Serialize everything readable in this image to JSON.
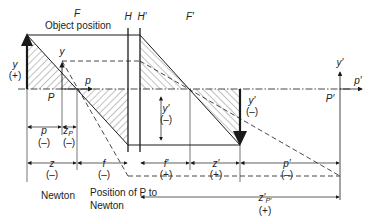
{
  "figure": {
    "title": "Object position",
    "principal_planes": {
      "H": "H",
      "H_prime": "H′"
    },
    "focal_points": {
      "F": "F",
      "F_prime": "F′"
    },
    "object": {
      "label": "y",
      "sign": "(+)"
    },
    "image": {
      "label": "y′",
      "sign": "(–)"
    },
    "image_mid": {
      "label": "y′",
      "sign": "(–)"
    },
    "pupil": {
      "P": "P",
      "y": "y",
      "p": "p"
    },
    "pupil_image": {
      "P_prime": "P′",
      "y_prime": "y′",
      "p_prime": "p′"
    },
    "dimensions": {
      "p": {
        "label": "p",
        "sign": "(–)"
      },
      "zP": {
        "label": "z",
        "sub": "P",
        "sign": "(–)"
      },
      "z": {
        "label": "z",
        "sign": "(–)"
      },
      "f": {
        "label": "f",
        "sign": "(–)"
      },
      "f_prime": {
        "label": "f′",
        "sign": "(+)"
      },
      "z_prime": {
        "label": "z′",
        "sign": "(+)"
      },
      "p_prime": {
        "label": "p′",
        "sign": "(–)"
      },
      "zP_prime": {
        "label": "z′",
        "sub": "P′",
        "sign": "(+)"
      }
    },
    "captions": {
      "newton": "Newton",
      "position_line1": "Position of P to",
      "position_line2": "Newton"
    }
  },
  "colors": {
    "line": "#1a1a1a",
    "hatch": "#333333",
    "text": "#222222"
  }
}
